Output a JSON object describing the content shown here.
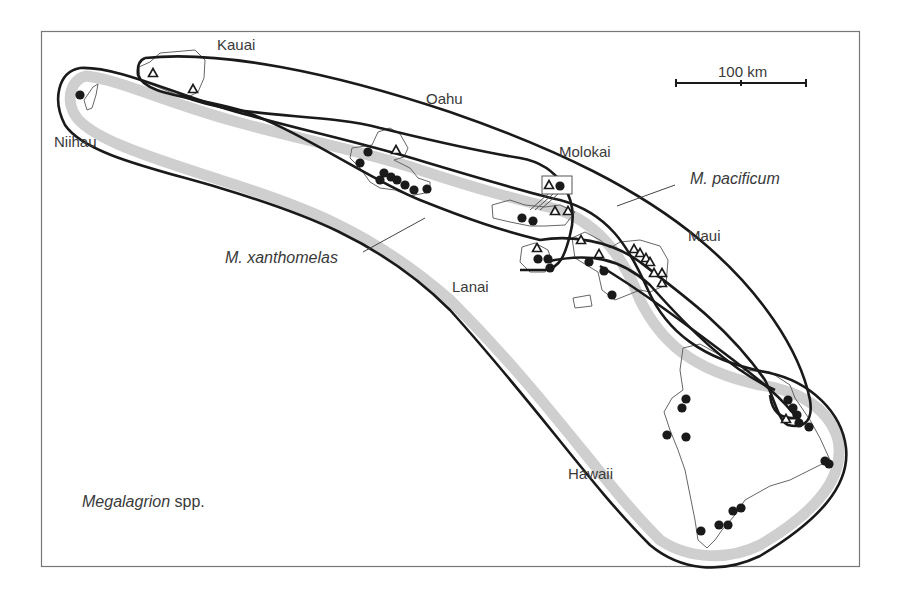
{
  "figure": {
    "title": "Megalagrion spp.",
    "title_italic_part": "Megalagrion",
    "title_suffix": " spp.",
    "frame": {
      "x": 41,
      "y": 31,
      "w": 818,
      "h": 535
    }
  },
  "colors": {
    "frame": "#777777",
    "outline": "#1a1a1a",
    "xanthomelas_band": "#cfcfcf",
    "coast": "#666666",
    "marker": "#1a1a1a",
    "text": "#3a3a3a"
  },
  "scale_bar": {
    "label": "100 km",
    "x1": 676,
    "x2": 806,
    "y": 83
  },
  "islands": [
    {
      "name": "Kauai",
      "label_x": 217,
      "label_y": 50
    },
    {
      "name": "Niihau",
      "label_x": 54,
      "label_y": 147
    },
    {
      "name": "Oahu",
      "label_x": 426,
      "label_y": 104
    },
    {
      "name": "Molokai",
      "label_x": 559,
      "label_y": 157
    },
    {
      "name": "Maui",
      "label_x": 688,
      "label_y": 241
    },
    {
      "name": "Lanai",
      "label_x": 452,
      "label_y": 292
    },
    {
      "name": "Hawaii",
      "label_x": 568,
      "label_y": 479
    }
  ],
  "species": [
    {
      "name": "M. pacificum",
      "marker": "triangle",
      "label_x": 690,
      "label_y": 184,
      "leader": [
        675,
        185,
        617,
        206
      ]
    },
    {
      "name": "M. xanthomelas",
      "marker": "circle",
      "label_x": 225,
      "label_y": 263,
      "leader": [
        363,
        252,
        425,
        218
      ]
    }
  ],
  "markers": {
    "circles": [
      [
        80,
        95
      ],
      [
        368,
        152
      ],
      [
        360,
        163
      ],
      [
        384,
        173
      ],
      [
        380,
        180
      ],
      [
        391,
        177
      ],
      [
        397,
        180
      ],
      [
        405,
        185
      ],
      [
        414,
        190
      ],
      [
        427,
        189
      ],
      [
        522,
        218
      ],
      [
        533,
        221
      ],
      [
        538,
        259
      ],
      [
        548,
        259
      ],
      [
        550,
        268
      ],
      [
        589,
        262
      ],
      [
        604,
        271
      ],
      [
        612,
        295
      ],
      [
        560,
        186
      ],
      [
        686,
        399
      ],
      [
        682,
        408
      ],
      [
        667,
        435
      ],
      [
        686,
        437
      ],
      [
        788,
        400
      ],
      [
        793,
        408
      ],
      [
        797,
        415
      ],
      [
        799,
        423
      ],
      [
        809,
        427
      ],
      [
        825,
        461
      ],
      [
        829,
        464
      ],
      [
        733,
        511
      ],
      [
        741,
        508
      ],
      [
        719,
        525
      ],
      [
        728,
        525
      ],
      [
        701,
        531
      ]
    ],
    "triangles": [
      [
        153,
        73
      ],
      [
        193,
        89
      ],
      [
        396,
        150
      ],
      [
        549,
        185
      ],
      [
        555,
        211
      ],
      [
        568,
        211
      ],
      [
        537,
        248
      ],
      [
        581,
        240
      ],
      [
        599,
        254
      ],
      [
        634,
        249
      ],
      [
        640,
        253
      ],
      [
        646,
        258
      ],
      [
        650,
        262
      ],
      [
        654,
        273
      ],
      [
        662,
        273
      ],
      [
        662,
        283
      ],
      [
        786,
        419
      ]
    ]
  }
}
